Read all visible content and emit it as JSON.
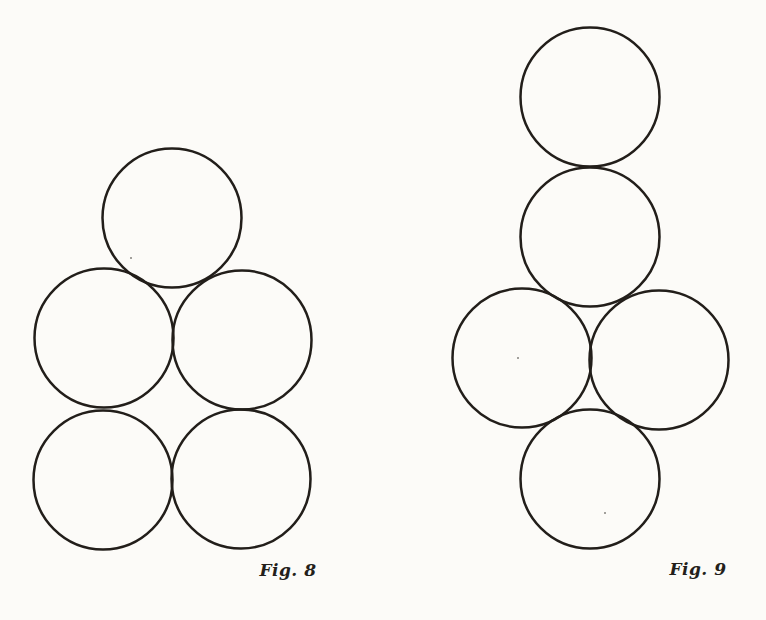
{
  "page": {
    "background_color": "#fcfbf8",
    "ink_color": "#221e1a",
    "stroke_width": 2.5,
    "noise_specks": [
      {
        "x": 131,
        "y": 258
      },
      {
        "x": 518,
        "y": 358
      },
      {
        "x": 605,
        "y": 513
      }
    ]
  },
  "figures": [
    {
      "id": "fig8",
      "label": "Fig. 8",
      "circle_radius": 69.5,
      "circles": [
        {
          "cx": 172,
          "cy": 218
        },
        {
          "cx": 104,
          "cy": 338
        },
        {
          "cx": 242,
          "cy": 340
        },
        {
          "cx": 103,
          "cy": 480
        },
        {
          "cx": 241,
          "cy": 479
        }
      ]
    },
    {
      "id": "fig9",
      "label": "Fig. 9",
      "circle_radius": 69.5,
      "circles": [
        {
          "cx": 590,
          "cy": 97
        },
        {
          "cx": 590,
          "cy": 237
        },
        {
          "cx": 522,
          "cy": 358
        },
        {
          "cx": 659,
          "cy": 360
        },
        {
          "cx": 590,
          "cy": 479
        }
      ]
    }
  ]
}
